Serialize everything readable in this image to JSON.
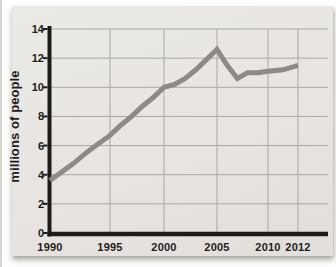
{
  "page": {
    "background": "#ffffff",
    "edge_artifact_color": "#c6c4c1"
  },
  "card": {
    "background": "#e7e4e1"
  },
  "chart_data": {
    "type": "line",
    "title": "",
    "xlabel": "",
    "ylabel": "millions of people",
    "x": [
      1990,
      1991,
      1992,
      1993,
      1994,
      1995,
      1996,
      1997,
      1998,
      1999,
      2000,
      2001,
      2002,
      2003,
      2004,
      2005,
      2006,
      2007,
      2008,
      2009,
      2010,
      2011,
      2012
    ],
    "values": [
      3.6,
      4.2,
      4.8,
      5.5,
      6.1,
      6.7,
      7.4,
      8.0,
      8.7,
      9.3,
      10.0,
      10.2,
      10.6,
      11.2,
      11.9,
      12.6,
      11.5,
      10.6,
      11.0,
      11.0,
      11.1,
      11.2,
      11.5
    ],
    "x_ticks": [
      "1990",
      "1995",
      "2000",
      "2005",
      "2010",
      "2012"
    ],
    "y_ticks": [
      0,
      2,
      4,
      6,
      8,
      10,
      12,
      14
    ],
    "ylim": [
      0,
      14
    ],
    "grid": true,
    "legend": "none",
    "line_color": "#8d8a87",
    "grid_color": "#aaa8a5",
    "axis_color": "#1e1c1a",
    "text_color": "#1f1d1b"
  }
}
